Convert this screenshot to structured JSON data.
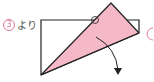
{
  "step_marker": {
    "number": "3",
    "text": "より"
  },
  "colors": {
    "pink_fill": "#f4b8c6",
    "line": "#222222",
    "accent": "#e07a9a"
  },
  "diagram": {
    "next_step_marker_partial": "("
  }
}
